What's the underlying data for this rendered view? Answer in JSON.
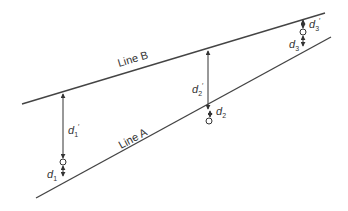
{
  "diagram": {
    "lines": [
      {
        "id": "line-b",
        "label": "Line B",
        "x1": 22,
        "y1": 104,
        "x2": 325,
        "y2": 13
      },
      {
        "id": "line-a",
        "label": "Line A",
        "x1": 36,
        "y1": 198,
        "x2": 331,
        "y2": 37
      }
    ],
    "points": [
      {
        "id": "p1",
        "x": 63,
        "line_b_y": 93,
        "circle_y": 162,
        "line_a_y": 177,
        "upper_label": "d",
        "upper_sub": "1",
        "upper_prime": "′",
        "lower_label": "d",
        "lower_sub": "1"
      },
      {
        "id": "p2",
        "x": 208,
        "line_b_y": 50,
        "circle_y": 121,
        "line_a_y": 110,
        "upper_label": "d",
        "upper_sub": "2",
        "upper_prime": "′",
        "lower_label": "d",
        "lower_sub": "2"
      },
      {
        "id": "p3",
        "x": 303,
        "line_b_y": 19,
        "circle_y": 32,
        "line_a_y": 47,
        "upper_label": "d",
        "upper_sub": "3",
        "upper_prime": "′",
        "lower_label": "d",
        "lower_sub": "3"
      }
    ],
    "labels": {
      "line_b": "Line B",
      "line_a": "Line A",
      "d1_prime": "d",
      "d1_prime_sub": "1",
      "d1": "d",
      "d1_sub": "1",
      "d2_prime": "d",
      "d2_prime_sub": "2",
      "d2": "d",
      "d2_sub": "2",
      "d3_prime": "d",
      "d3_prime_sub": "3",
      "d3": "d",
      "d3_sub": "3",
      "prime": "′"
    },
    "colors": {
      "line": "#444444",
      "text": "#333333",
      "background": "#ffffff"
    }
  }
}
